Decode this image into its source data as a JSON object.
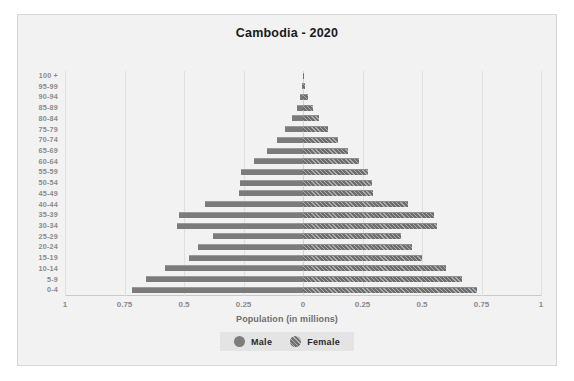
{
  "chart": {
    "title": "Cambodia - 2020",
    "xlabel": "Population (in millions)"
  },
  "legend": {
    "position": "bottom",
    "items": [
      {
        "label": "Male",
        "swatch": "circle-marker-male"
      },
      {
        "label": "Female",
        "swatch": "circle-marker-female"
      }
    ]
  },
  "chart_data": {
    "type": "bar",
    "subtype": "population-pyramid",
    "title": "Cambodia - 2020",
    "xlabel": "Population (in millions)",
    "ylabel": "",
    "grid": true,
    "legend_position": "bottom",
    "orientation": "horizontal",
    "axis_ticks": [
      "1",
      "0.75",
      "0.5",
      "0.25",
      "0",
      "0.25",
      "0.5",
      "0.75",
      "1"
    ],
    "axis_tick_values": [
      1,
      0.75,
      0.5,
      0.25,
      0,
      0.25,
      0.5,
      0.75,
      1
    ],
    "xlim": [
      -1,
      1
    ],
    "categories": [
      "100 +",
      "95-99",
      "90-94",
      "85-89",
      "80-84",
      "75-79",
      "70-74",
      "65-69",
      "60-64",
      "55-59",
      "50-54",
      "45-49",
      "40-44",
      "35-39",
      "30-34",
      "25-29",
      "20-24",
      "15-19",
      "10-14",
      "5-9",
      "0-4"
    ],
    "series": [
      {
        "name": "Male",
        "color": "#7b7b7b",
        "values": [
          0.001,
          0.004,
          0.012,
          0.025,
          0.045,
          0.075,
          0.11,
          0.15,
          0.205,
          0.26,
          0.265,
          0.27,
          0.41,
          0.52,
          0.53,
          0.38,
          0.44,
          0.48,
          0.58,
          0.66,
          0.72
        ]
      },
      {
        "name": "Female",
        "color": "#6f6f6f",
        "values": [
          0.002,
          0.008,
          0.022,
          0.042,
          0.068,
          0.105,
          0.145,
          0.19,
          0.235,
          0.275,
          0.29,
          0.295,
          0.44,
          0.55,
          0.565,
          0.41,
          0.46,
          0.5,
          0.6,
          0.67,
          0.73
        ]
      }
    ]
  }
}
